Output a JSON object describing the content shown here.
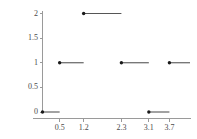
{
  "chart_data": {
    "type": "line",
    "title": "",
    "xlabel": "",
    "ylabel": "",
    "grid": false,
    "legend": "none",
    "xlim": [
      0.0,
      4.3
    ],
    "ylim": [
      0.0,
      2.12
    ],
    "xticks": [
      0.5,
      1.2,
      2.3,
      3.1,
      3.7
    ],
    "xtick_labels": [
      "0.5",
      "1.2",
      "2.3",
      "3.1",
      "3.7"
    ],
    "yticks": [
      0,
      0.5,
      1,
      1.5,
      2
    ],
    "ytick_labels": [
      "0",
      "0.5",
      "1",
      "1.5",
      "2"
    ],
    "segments": [
      {
        "x_start": 0.0,
        "x_end": 0.5,
        "y": 0,
        "closed_left": true
      },
      {
        "x_start": 0.5,
        "x_end": 1.2,
        "y": 1,
        "closed_left": true
      },
      {
        "x_start": 1.2,
        "x_end": 2.3,
        "y": 2,
        "closed_left": true
      },
      {
        "x_start": 2.3,
        "x_end": 3.1,
        "y": 1,
        "closed_left": true
      },
      {
        "x_start": 3.1,
        "x_end": 3.7,
        "y": 0,
        "closed_left": true
      },
      {
        "x_start": 3.7,
        "x_end": 4.3,
        "y": 1,
        "closed_left": true
      }
    ],
    "points": [
      {
        "x": 0.0,
        "y": 0
      },
      {
        "x": 0.5,
        "y": 1
      },
      {
        "x": 1.2,
        "y": 2
      },
      {
        "x": 2.3,
        "y": 1
      },
      {
        "x": 3.1,
        "y": 0
      },
      {
        "x": 3.7,
        "y": 1
      }
    ],
    "colors": {
      "line": "#565656",
      "marker": "#1a1a1a",
      "axis": "#9a9a9a",
      "tick_text": "#4a4a4a",
      "background": "#ffffff"
    }
  }
}
